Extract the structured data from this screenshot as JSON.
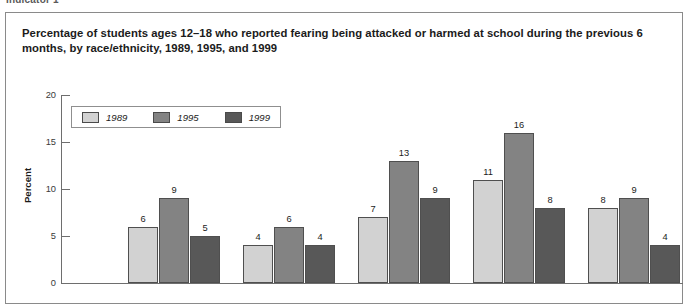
{
  "running_head": "Indicator 1",
  "title": "Percentage of students ages 12–18 who reported fearing being attacked or harmed at school during the previous 6 months, by race/ethnicity, 1989, 1995, and 1999",
  "axis": {
    "y_title": "Percent",
    "y_ticks": [
      "20",
      "15",
      "10",
      "5",
      "0"
    ]
  },
  "legend": {
    "items": [
      {
        "label": "1989",
        "color": "#d2d2d2"
      },
      {
        "label": "1995",
        "color": "#838383"
      },
      {
        "label": "1999",
        "color": "#585858"
      }
    ]
  },
  "chart_data": {
    "type": "bar",
    "title": "Percentage of students ages 12–18 who reported fearing being attacked or harmed at school during the previous 6 months, by race/ethnicity, 1989, 1995, and 1999",
    "xlabel": "",
    "ylabel": "Percent",
    "ylim": [
      0,
      20
    ],
    "yticks": [
      0,
      5,
      10,
      15,
      20
    ],
    "grid": false,
    "legend_position": "top-left",
    "categories": [
      "group-1",
      "group-2",
      "group-3",
      "group-4",
      "group-5"
    ],
    "series": [
      {
        "name": "1989",
        "color": "#d2d2d2",
        "values": [
          6,
          4,
          7,
          11,
          8
        ]
      },
      {
        "name": "1995",
        "color": "#838383",
        "values": [
          9,
          6,
          13,
          16,
          9
        ]
      },
      {
        "name": "1999",
        "color": "#585858",
        "values": [
          5,
          4,
          9,
          8,
          4
        ]
      }
    ],
    "data_labels": [
      [
        "6",
        "9",
        "5"
      ],
      [
        "4",
        "6",
        "4"
      ],
      [
        "7",
        "13",
        "9"
      ],
      [
        "11",
        "16",
        "8"
      ],
      [
        "8",
        "9",
        "4"
      ]
    ]
  }
}
